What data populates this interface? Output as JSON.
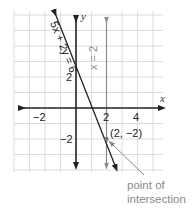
{
  "diagram": {
    "title": "",
    "grid": {
      "x_min": -4,
      "x_max": 5,
      "y_min": -4,
      "y_max": 6,
      "step": 1
    },
    "axes": {
      "x_label": "x",
      "y_label": "y",
      "x_ticks": [
        {
          "value": -2,
          "label": "−2"
        },
        {
          "value": 2,
          "label": "2"
        },
        {
          "value": 4,
          "label": "4"
        }
      ],
      "y_ticks": [
        {
          "value": 2,
          "label": "2"
        },
        {
          "value": -2,
          "label": "−2"
        }
      ]
    },
    "lines": [
      {
        "equation": "5x + 2y = 6",
        "label": "5x + 2y = 6",
        "color": "#222222"
      },
      {
        "equation": "x = 2",
        "label": "x = 2",
        "color": "#8a8a8a"
      }
    ],
    "intersection": {
      "x": 2,
      "y": -2,
      "label": "(2, −2)"
    },
    "annotation": {
      "line1": "point of",
      "line2": "intersection",
      "color": "#8a8a8a"
    },
    "colors": {
      "grid": "#d9d9d9",
      "axis": "#222222",
      "vertical_line": "#8a8a8a"
    }
  }
}
